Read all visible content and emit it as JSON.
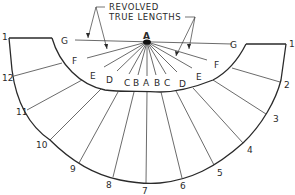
{
  "diagram": {
    "annotation": {
      "line1": "REVOLVED",
      "line2": "TRUE LENGTHS"
    },
    "apex_label": "A",
    "element_labels_left": [
      "G",
      "F",
      "E",
      "D",
      "C",
      "B"
    ],
    "element_labels_center": "A",
    "element_labels_right": [
      "B",
      "C",
      "D",
      "E",
      "F",
      "G"
    ],
    "left_labels": {
      "G": "G",
      "F": "F",
      "E": "E",
      "D": "D",
      "C": "C",
      "B": "B"
    },
    "center_label": "A",
    "right_labels": {
      "B": "B",
      "C": "C",
      "D": "D",
      "E": "E",
      "F": "F",
      "G": "G"
    },
    "outer_points": {
      "p1_left": "1",
      "p12": "12",
      "p11": "11",
      "p10": "10",
      "p9": "9",
      "p8": "8",
      "p7": "7",
      "p6": "6",
      "p5": "5",
      "p4": "4",
      "p3": "3",
      "p2": "2",
      "p1_right": "1"
    },
    "colors": {
      "line": "#2a2a2a",
      "background": "#ffffff"
    }
  }
}
